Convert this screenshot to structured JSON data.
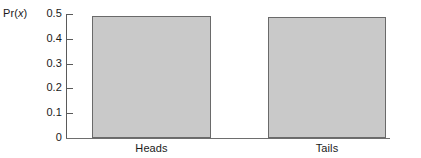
{
  "chart_data": {
    "type": "bar",
    "title": "",
    "xlabel": "",
    "ylabel": "Pr(x)",
    "categories": [
      "Heads",
      "Tails"
    ],
    "values": [
      0.492,
      0.488
    ],
    "ylim": [
      0,
      0.5
    ],
    "yticks": [
      "0",
      "0.1",
      "0.2",
      "0.3",
      "0.4",
      "0.5"
    ],
    "ytick_values": [
      0,
      0.1,
      0.2,
      0.3,
      0.4,
      0.5
    ],
    "grid": false,
    "legend": "none",
    "bar_fill_color": "#c9c9c9",
    "bar_edge_color": "#6a6a6a",
    "axis_color": "#5a5a5a"
  },
  "axis": {
    "y_label_prefix": "Pr(",
    "y_label_variable": "x",
    "y_label_suffix": ")"
  }
}
